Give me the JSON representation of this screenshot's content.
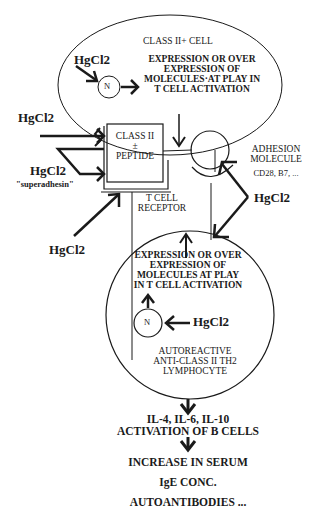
{
  "diagram": {
    "class_ii_cell": {
      "title": "CLASS  II+ CELL",
      "expression_lines": [
        "EXPRESSION OR OVER",
        "EXPRESSION OF",
        "MOLECULES·AT PLAY IN",
        "T CELL ACTIVATION"
      ],
      "nucleus_label": "N",
      "hgcl2_label": "HgCl2"
    },
    "mhc_box": {
      "lines": [
        "CLASS  II",
        "±",
        "PEPTIDE"
      ]
    },
    "left_inputs": {
      "hgcl2_top": "HgCl2",
      "hgcl2_mid": "HgCl2",
      "superadhesin": "\"superadhesin\"",
      "hgcl2_bottom": "HgCl2"
    },
    "t_cell_receptor": [
      "T CELL",
      "RECEPTOR"
    ],
    "adhesion": {
      "lines": [
        "ADHESION",
        "MOLECULE",
        "CD28, B7, ..."
      ],
      "hgcl2_label": "HgCl2"
    },
    "t_cell": {
      "expression_lines": [
        "EXPRESSION OR OVER",
        "EXPRESSION OF",
        "MOLECULES AT PLAY",
        "IN T CELL ACTIVATION"
      ],
      "nucleus_label": "N",
      "hgcl2_label": "HgCl2",
      "cell_lines": [
        "AUTOREACTIVE",
        "ANTI-CLASS II TH2",
        "LYMPHOCYTE"
      ]
    },
    "outcomes": {
      "cytokines": "IL-4, IL-6, IL-10",
      "b_cells": "ACTIVATION OF B CELLS",
      "serum": "INCREASE IN SERUM",
      "ige": "IgE CONC.",
      "autoantibodies": "AUTOANTIBODIES ..."
    }
  }
}
